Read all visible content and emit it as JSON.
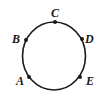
{
  "diagram": {
    "type": "circle-with-points",
    "colors": {
      "stroke": "#1a1a1a",
      "point": "#1a1a1a",
      "background": "#ffffff"
    },
    "points": [
      {
        "id": "C",
        "label": "C",
        "position": "top"
      },
      {
        "id": "D",
        "label": "D",
        "position": "upper-right"
      },
      {
        "id": "E",
        "label": "E",
        "position": "lower-right"
      },
      {
        "id": "A",
        "label": "A",
        "position": "lower-left"
      },
      {
        "id": "B",
        "label": "B",
        "position": "upper-left"
      }
    ]
  }
}
